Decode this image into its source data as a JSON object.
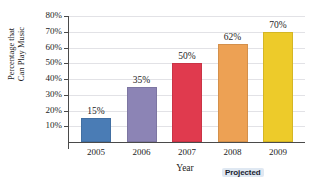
{
  "chart_data": {
    "type": "bar",
    "title": "",
    "xlabel": "Year",
    "ylabel": "Percentage that Can Play Music",
    "ylabel_line1": "Percentage that",
    "ylabel_line2": "Can Play Music",
    "categories": [
      "2005",
      "2006",
      "2007",
      "2008",
      "2009"
    ],
    "values": [
      15,
      35,
      50,
      62,
      70
    ],
    "value_labels": [
      "15%",
      "35%",
      "50%",
      "62%",
      "70%"
    ],
    "ylim": [
      0,
      80
    ],
    "ytick_values": [
      10,
      20,
      30,
      40,
      50,
      60,
      70,
      80
    ],
    "ytick_labels": [
      "10%",
      "20%",
      "30%",
      "40%",
      "50%",
      "60%",
      "70%",
      "80%"
    ],
    "grid": true,
    "legend": "none",
    "bar_colors": [
      "#4a7cb5",
      "#8c84b5",
      "#e03a4e",
      "#eda154",
      "#edcb2a"
    ],
    "annotations": [
      {
        "text": "Projected",
        "applies_to": [
          "2008",
          "2009"
        ]
      }
    ]
  },
  "axis": {
    "y_title_line1": "Percentage that",
    "y_title_line2": "Can Play Music",
    "x_title": "Year"
  },
  "badge": {
    "projected_label": "Projected"
  },
  "colors": {
    "axis_line": "#4a4a4a",
    "gridline": "#e2e2e6",
    "text": "#1d1d1d",
    "badge_bg": "#dfe8f2",
    "badge_text": "#1b2430"
  }
}
